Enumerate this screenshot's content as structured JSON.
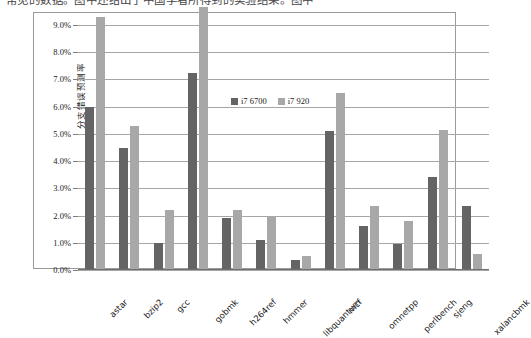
{
  "top_text": "常见的数据。图中还给出了中国学者所得到的实验结果。图中",
  "chart_data": {
    "type": "bar",
    "title": "",
    "xlabel": "",
    "ylabel": "分支错误预测率",
    "ylim": [
      0,
      9.0
    ],
    "ytick_values": [
      0.0,
      1.0,
      2.0,
      3.0,
      4.0,
      5.0,
      6.0,
      7.0,
      8.0,
      9.0
    ],
    "ytick_labels": [
      "0.0%",
      "1.0%",
      "2.0%",
      "3.0%",
      "4.0%",
      "5.0%",
      "6.0%",
      "7.0%",
      "8.0%",
      "9.0%"
    ],
    "grid": true,
    "legend_position": "inside-top-center",
    "categories": [
      "astar",
      "bzip2",
      "gcc",
      "gobmk",
      "h264ref",
      "hmmer",
      "libquantum",
      "mcf",
      "omnetpp",
      "perlbench",
      "sjeng",
      "xalancbmk"
    ],
    "series": [
      {
        "name": "i7 6700",
        "color": "#646464",
        "values": [
          6.0,
          4.5,
          1.0,
          7.25,
          1.9,
          1.1,
          0.35,
          5.1,
          1.6,
          0.95,
          3.4,
          2.35
        ]
      },
      {
        "name": "i7 920",
        "color": "#a8a8a8",
        "values": [
          9.3,
          5.3,
          2.2,
          9.65,
          2.2,
          2.0,
          0.5,
          6.5,
          2.35,
          1.8,
          5.15,
          0.6
        ]
      }
    ]
  }
}
